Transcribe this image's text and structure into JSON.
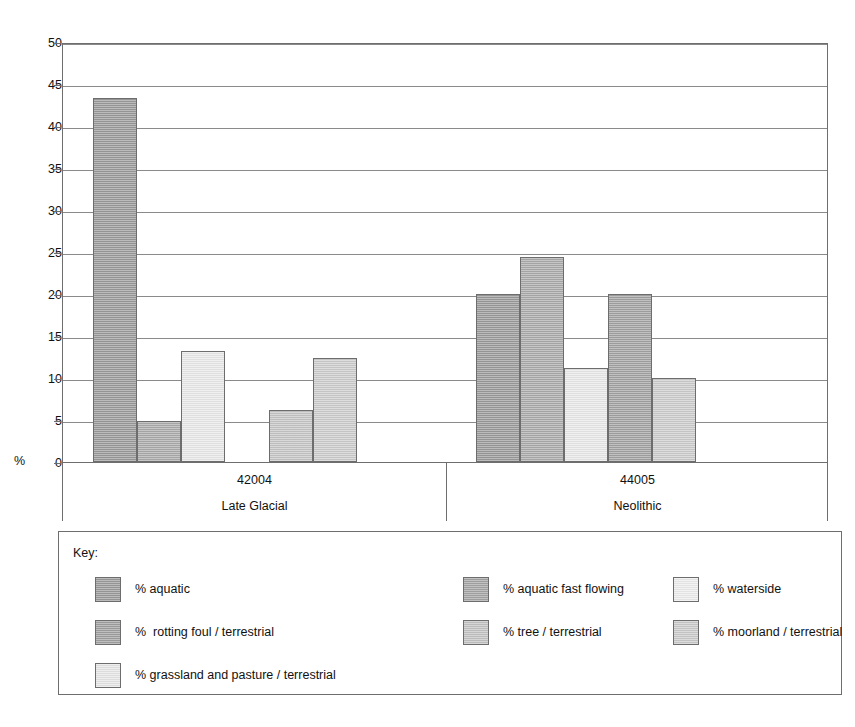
{
  "chart_data": {
    "type": "bar",
    "title": "",
    "subtitle": "",
    "xlabel": "",
    "ylabel": "%",
    "ylim": [
      0,
      50
    ],
    "ytick_step": 5,
    "yticks": [
      "50",
      "45",
      "40",
      "35",
      "30",
      "25",
      "20",
      "15",
      "10",
      "5",
      "0"
    ],
    "grid": true,
    "legend_position": "below-plot",
    "legend_title": "Key:",
    "categories": [
      "42004",
      "44005"
    ],
    "category_sublabels": [
      "Late Glacial",
      "Neolithic"
    ],
    "series": [
      {
        "name": "% aquatic",
        "color": "#9b9b9b",
        "values": [
          43.3,
          20.0
        ]
      },
      {
        "name": "% aquatic fast flowing",
        "color": "#ababab",
        "values": [
          4.9,
          24.4
        ]
      },
      {
        "name": "% waterside",
        "color": "#e9e9e9",
        "values": [
          13.2,
          11.2
        ]
      },
      {
        "name": "% grassland and pasture / terrestrial",
        "color": "#e4e4e4",
        "values": [
          0,
          0
        ]
      },
      {
        "name": "%  rotting foul / terrestrial",
        "color": "#a3a3a3",
        "values": [
          0,
          20.0
        ]
      },
      {
        "name": "% tree / terrestrial",
        "color": "#c6c6c6",
        "values": [
          6.2,
          10.0
        ]
      },
      {
        "name": "% moorland / terrestrial",
        "color": "#cdcdcd",
        "values": [
          12.4,
          0
        ]
      }
    ],
    "groups": [
      {
        "code": "42004",
        "period": "Late Glacial",
        "bars": [
          {
            "series": "% aquatic",
            "value": 43.3,
            "color": "#9b9b9b",
            "slot": 0
          },
          {
            "series": "% aquatic fast flowing",
            "value": 4.9,
            "color": "#ababab",
            "slot": 1
          },
          {
            "series": "% waterside",
            "value": 13.2,
            "color": "#e9e9e9",
            "slot": 2
          },
          {
            "series": "% tree / terrestrial",
            "value": 6.2,
            "color": "#c6c6c6",
            "slot": 4
          },
          {
            "series": "% moorland / terrestrial",
            "value": 12.4,
            "color": "#cdcdcd",
            "slot": 5
          }
        ]
      },
      {
        "code": "44005",
        "period": "Neolithic",
        "bars": [
          {
            "series": "% aquatic",
            "value": 20.0,
            "color": "#9b9b9b",
            "slot": 0
          },
          {
            "series": "% aquatic fast flowing",
            "value": 24.4,
            "color": "#ababab",
            "slot": 1
          },
          {
            "series": "% waterside",
            "value": 11.2,
            "color": "#e9e9e9",
            "slot": 2
          },
          {
            "series": "%  rotting foul / terrestrial",
            "value": 20.0,
            "color": "#a3a3a3",
            "slot": 3
          },
          {
            "series": "% tree / terrestrial",
            "value": 10.0,
            "color": "#cdcdcd",
            "slot": 4
          }
        ]
      }
    ]
  },
  "legend": {
    "title": "Key:",
    "entries": [
      {
        "label": "% aquatic",
        "color": "#9b9b9b",
        "col": 0,
        "row": 0
      },
      {
        "label": "% aquatic fast flowing",
        "color": "#a5a5a5",
        "col": 1,
        "row": 0
      },
      {
        "label": "% waterside",
        "color": "#ededed",
        "col": 2,
        "row": 0
      },
      {
        "label": "%  rotting foul / terrestrial",
        "color": "#a0a0a0",
        "col": 0,
        "row": 1
      },
      {
        "label": "% tree / terrestrial",
        "color": "#c3c3c3",
        "col": 1,
        "row": 1
      },
      {
        "label": "% moorland / terrestrial",
        "color": "#cbcbcb",
        "col": 2,
        "row": 1
      },
      {
        "label": "% grassland and pasture / terrestrial",
        "color": "#e6e6e6",
        "col": 0,
        "row": 2
      }
    ]
  }
}
